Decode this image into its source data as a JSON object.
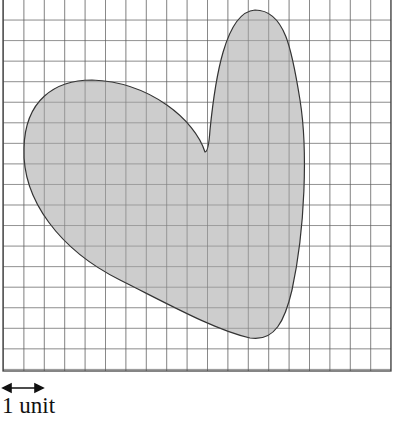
{
  "figure": {
    "grid": {
      "columns": 19,
      "rows": 18,
      "cell_px": 20.4
    },
    "shape": {
      "name": "heart",
      "fill": "#c9c9c9",
      "stroke": "#333333"
    },
    "grid_color": "#555555",
    "scale": {
      "arrow": "double-headed",
      "label": "1 unit"
    }
  }
}
